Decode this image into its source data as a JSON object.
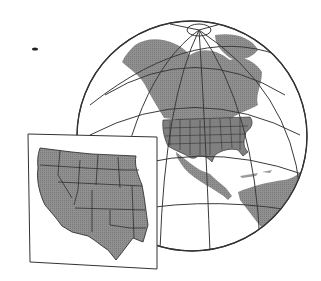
{
  "figure": {
    "colors": {
      "land": "#8a8a8a",
      "ocean": "#ffffff",
      "lines": "#3a3a3a",
      "background": "#ffffff"
    },
    "globe": {
      "cx": 192,
      "cy": 136,
      "r": 115
    },
    "inset": {
      "label": "western-us-inset"
    }
  }
}
